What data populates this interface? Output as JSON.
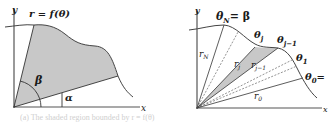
{
  "left_panel": {
    "axis_x_label": "x",
    "axis_y_label": "y",
    "curve_label": "r = f(θ)",
    "angle_beta_label": "β",
    "angle_alpha_label": "α",
    "fill_color": "#c8c8c8"
  },
  "right_panel": {
    "axis_x_label": "x",
    "axis_y_label": "y",
    "theta_N_label": "θ",
    "theta_N_sub": "N",
    "theta_N_eq": "= β",
    "theta_j_label": "θ",
    "theta_j_sub": "j",
    "theta_j1_label": "θ",
    "theta_j1_sub": "j−1",
    "theta_1_label": "θ",
    "theta_1_sub": "1",
    "theta_0_label": "θ",
    "theta_0_sub": "0",
    "theta_0_eq": "=",
    "r_N_label": "r",
    "r_N_sub": "N",
    "r_j_label": "r",
    "r_j_sub": "j",
    "r_j1_label": "r",
    "r_j1_sub": "j−1",
    "r_0_label": "r",
    "r_0_sub": "0",
    "fill_color": "#c8c8c8"
  },
  "caption": {
    "text": "(a) The shaded region bounded by r = f(θ)"
  }
}
